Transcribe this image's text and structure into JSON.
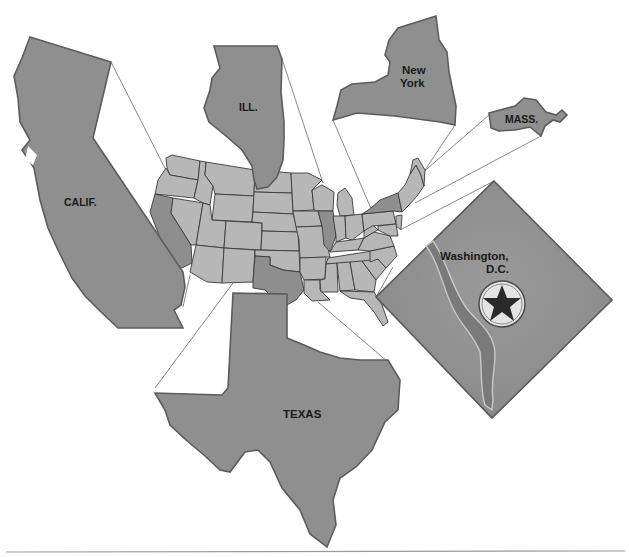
{
  "map": {
    "title": "",
    "subject": "United States with enlarged states",
    "colors": {
      "enlarged_state_fill": "#8f8f8f",
      "us_state_fill": "#b7b7b7",
      "highlighted_state_fill": "#8e8e8e",
      "border": "#3a3a3a",
      "connector_line": "#6b6b6b",
      "background": "#ffffff",
      "star_fill": "#2a2a2a",
      "star_background": "#e3e3e3"
    },
    "callouts": [
      {
        "id": "california",
        "label": "CALIF."
      },
      {
        "id": "illinois",
        "label": "ILL."
      },
      {
        "id": "new-york",
        "label_line1": "New",
        "label_line2": "York"
      },
      {
        "id": "massachusetts",
        "label": "MASS."
      },
      {
        "id": "washington-dc",
        "label_line1": "Washington,",
        "label_line2": "D.C.",
        "icon": "capital-star-icon"
      },
      {
        "id": "texas",
        "label": "TEXAS"
      }
    ]
  }
}
